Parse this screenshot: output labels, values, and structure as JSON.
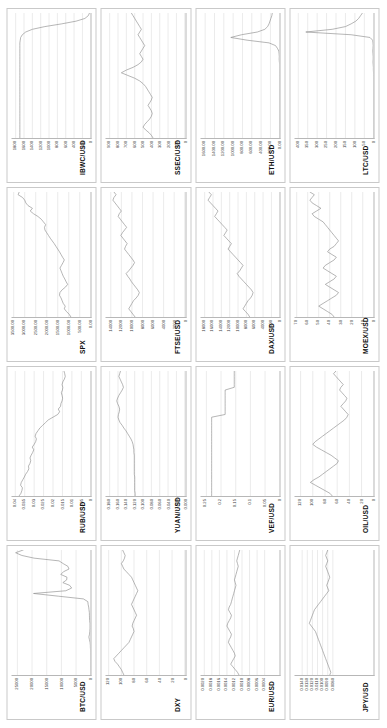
{
  "figure": {
    "type": "small-multiples-grid",
    "rows": 4,
    "columns": 4,
    "series_color": "#8e8e8e",
    "grid_color": "#d7d7d7",
    "axis_color": "#b7b7b7",
    "panel_border_color": "#c9c9c9",
    "background": "#ffffff"
  },
  "chart_data": [
    {
      "type": "line",
      "title": "BTC/USD",
      "xlabel": "",
      "ylabel": "",
      "grid": true,
      "ylim": [
        0,
        27000
      ],
      "yticks": [
        25000,
        20000,
        15000,
        10000,
        5000,
        0
      ],
      "ytick_labels": [
        "25000",
        "20000",
        "15000",
        "10000",
        "5000",
        "0"
      ],
      "values": [
        0,
        0,
        0,
        0,
        0,
        0,
        0,
        0,
        5,
        40,
        120,
        140,
        230,
        450,
        640,
        420,
        330,
        250,
        240,
        250,
        380,
        430,
        450,
        470,
        600,
        700,
        900,
        1000,
        2500,
        11000,
        19500,
        8500,
        6500,
        7200,
        9500,
        8200,
        8100,
        10200,
        9300,
        7400,
        7800,
        9400,
        10800,
        19300,
        23500,
        25600,
        23000
      ]
    },
    {
      "type": "line",
      "title": "RUB/USD",
      "xlabel": "",
      "ylabel": "",
      "grid": true,
      "ylim": [
        0,
        0.042
      ],
      "yticks": [
        0.04,
        0.035,
        0.03,
        0.025,
        0.02,
        0.015,
        0.01,
        0.005,
        0
      ],
      "ytick_labels": [
        "0.04",
        "0.035",
        "0.03",
        "0.025",
        "0.02",
        "0.015",
        "0.01",
        "0.005",
        "0"
      ],
      "values": [
        0.038,
        0.037,
        0.0365,
        0.0362,
        0.0372,
        0.0368,
        0.036,
        0.0352,
        0.0345,
        0.0335,
        0.0328,
        0.033,
        0.0322,
        0.0318,
        0.0322,
        0.0316,
        0.0308,
        0.0302,
        0.031,
        0.03,
        0.0292,
        0.0288,
        0.0295,
        0.029,
        0.028,
        0.027,
        0.0255,
        0.024,
        0.0225,
        0.02,
        0.0175,
        0.0165,
        0.0172,
        0.016,
        0.0158,
        0.0152,
        0.0149,
        0.0152,
        0.0156,
        0.015,
        0.0148,
        0.0152,
        0.0148,
        0.014,
        0.0135,
        0.0138,
        0.0142
      ]
    },
    {
      "type": "line",
      "title": "SPX",
      "xlabel": "",
      "ylabel": "",
      "grid": true,
      "ylim": [
        0,
        3600
      ],
      "yticks": [
        3500,
        3000,
        2500,
        2000,
        1500,
        1000,
        500,
        0
      ],
      "ytick_labels": [
        "3500.00",
        "3000.00",
        "2500.00",
        "2000.00",
        "1500.00",
        "1000.00",
        "500.00",
        "0.00"
      ],
      "values": [
        900,
        980,
        1100,
        1200,
        1160,
        1250,
        1300,
        1350,
        1420,
        1400,
        1300,
        1150,
        1050,
        1120,
        1180,
        1250,
        1300,
        1350,
        1400,
        1330,
        1260,
        1200,
        1280,
        1350,
        1420,
        1500,
        1580,
        1660,
        1750,
        1840,
        1920,
        2000,
        2080,
        2100,
        2050,
        2150,
        2250,
        2400,
        2600,
        2750,
        2650,
        2850,
        2950,
        3000,
        3100,
        3300,
        3250
      ]
    },
    {
      "type": "line",
      "title": "IBWC/USD",
      "xlabel": "",
      "ylabel": "",
      "grid": true,
      "ylim": [
        0,
        1900
      ],
      "yticks": [
        1800,
        1600,
        1400,
        1200,
        1000,
        800,
        600,
        400,
        200,
        0
      ],
      "ytick_labels": [
        "1800",
        "1600",
        "1400",
        "1200",
        "1000",
        "800",
        "600",
        "400",
        "200",
        "0"
      ],
      "values": [
        1700,
        1700,
        1700,
        1700,
        1700,
        1700,
        1700,
        1700,
        1700,
        1700,
        1700,
        1700,
        1700,
        1700,
        1700,
        1700,
        1700,
        1700,
        1700,
        1700,
        1700,
        1700,
        1700,
        1700,
        1700,
        1700,
        1700,
        1700,
        1700,
        1700,
        1700,
        1700,
        1700,
        1700,
        1700,
        1700,
        1690,
        1680,
        1640,
        1560,
        1400,
        1100,
        700,
        350,
        140,
        60,
        30
      ]
    },
    {
      "type": "line",
      "title": "DXY",
      "xlabel": "",
      "ylabel": "",
      "grid": true,
      "ylim": [
        0,
        125
      ],
      "yticks": [
        120,
        100,
        80,
        60,
        40,
        20,
        0
      ],
      "ytick_labels": [
        "120",
        "100",
        "80",
        "60",
        "40",
        "20",
        "0"
      ],
      "values": [
        96,
        98,
        100,
        103,
        106,
        110,
        112,
        108,
        104,
        100,
        96,
        92,
        88,
        86,
        84,
        82,
        80,
        81,
        83,
        82,
        80,
        78,
        76,
        78,
        80,
        82,
        84,
        82,
        80,
        78,
        76,
        74,
        76,
        78,
        80,
        82,
        84,
        88,
        92,
        96,
        98,
        100,
        97,
        95,
        94,
        96,
        98
      ]
    },
    {
      "type": "line",
      "title": "YUAN/USD",
      "xlabel": "",
      "ylabel": "",
      "grid": true,
      "ylim": [
        0,
        0.19
      ],
      "yticks": [
        0.18,
        0.16,
        0.14,
        0.12,
        0.1,
        0.08,
        0.06,
        0.04,
        0.02,
        0.0
      ],
      "ytick_labels": [
        "0.180",
        "0.160",
        "0.140",
        "0.120",
        "0.100",
        "0.080",
        "0.060",
        "0.040",
        "0.020",
        "0.000"
      ],
      "values": [
        0.119,
        0.119,
        0.12,
        0.12,
        0.12,
        0.12,
        0.12,
        0.12,
        0.121,
        0.121,
        0.121,
        0.121,
        0.121,
        0.121,
        0.121,
        0.121,
        0.122,
        0.122,
        0.123,
        0.124,
        0.126,
        0.129,
        0.133,
        0.137,
        0.141,
        0.146,
        0.15,
        0.155,
        0.158,
        0.16,
        0.159,
        0.157,
        0.156,
        0.158,
        0.161,
        0.163,
        0.161,
        0.158,
        0.154,
        0.15,
        0.147,
        0.149,
        0.152,
        0.155,
        0.158,
        0.156,
        0.154
      ]
    },
    {
      "type": "line",
      "title": "FTSE/USD",
      "xlabel": "",
      "ylabel": "",
      "grid": true,
      "ylim": [
        0,
        15000
      ],
      "yticks": [
        14000,
        12000,
        10000,
        8000,
        6000,
        4000,
        2000,
        0
      ],
      "ytick_labels": [
        "14000",
        "12000",
        "10000",
        "8000",
        "6000",
        "4000",
        "2000",
        "0"
      ],
      "values": [
        9400,
        9800,
        10200,
        10600,
        10300,
        10000,
        9700,
        9200,
        8800,
        8600,
        8900,
        9300,
        9700,
        10100,
        10400,
        10800,
        11100,
        10600,
        10200,
        9800,
        9500,
        9800,
        10200,
        10600,
        11000,
        11400,
        11200,
        10900,
        11300,
        11700,
        12100,
        11800,
        11400,
        11000,
        11400,
        11800,
        12200,
        12600,
        12400,
        12000,
        12400,
        12800,
        13200,
        13600,
        13400,
        13000,
        13400
      ]
    },
    {
      "type": "line",
      "title": "SSEC/USD",
      "xlabel": "",
      "ylabel": "",
      "grid": true,
      "ylim": [
        0,
        950
      ],
      "yticks": [
        900,
        800,
        700,
        600,
        500,
        400,
        300,
        200,
        100,
        0
      ],
      "ytick_labels": [
        "900",
        "800",
        "700",
        "600",
        "500",
        "400",
        "300",
        "200",
        "100",
        "0"
      ],
      "values": [
        380,
        400,
        430,
        470,
        500,
        480,
        450,
        420,
        400,
        390,
        400,
        420,
        440,
        420,
        400,
        390,
        410,
        430,
        450,
        470,
        500,
        540,
        600,
        680,
        760,
        700,
        620,
        560,
        520,
        500,
        520,
        540,
        520,
        500,
        480,
        500,
        520,
        540,
        560,
        540,
        520,
        540,
        560,
        580,
        600,
        620,
        640
      ]
    },
    {
      "type": "line",
      "title": "EUR/USD",
      "xlabel": "",
      "ylabel": "",
      "grid": true,
      "ylim": [
        0,
        0.0021
      ],
      "yticks": [
        0.002,
        0.0018,
        0.0016,
        0.0014,
        0.0012,
        0.001,
        0.0008,
        0.0006,
        0.0004
      ],
      "ytick_labels": [
        "0.0020",
        "0.0018",
        "0.0016",
        "0.0014",
        "0.0012",
        "0.0010",
        "0.0008",
        "0.0006",
        "0.0004"
      ],
      "values": [
        0.00108,
        0.00112,
        0.00118,
        0.00124,
        0.0013,
        0.00126,
        0.00122,
        0.00118,
        0.0012,
        0.00124,
        0.00128,
        0.00132,
        0.00136,
        0.00134,
        0.0013,
        0.00128,
        0.00132,
        0.00136,
        0.0014,
        0.00138,
        0.00134,
        0.0013,
        0.00128,
        0.00132,
        0.00136,
        0.00134,
        0.0013,
        0.00128,
        0.00126,
        0.00124,
        0.00122,
        0.0012,
        0.00118,
        0.00116,
        0.00118,
        0.0012,
        0.00118,
        0.00116,
        0.00114,
        0.00112,
        0.0011,
        0.00112,
        0.00114,
        0.00112,
        0.0011,
        0.00108,
        0.00106
      ]
    },
    {
      "type": "line",
      "title": "VEF/USD",
      "xlabel": "",
      "ylabel": "",
      "grid": true,
      "ylim": [
        0,
        0.27
      ],
      "yticks": [
        0.25,
        0.2,
        0.15,
        0.1,
        0.05,
        0
      ],
      "ytick_labels": [
        "0.25",
        "0.2",
        "0.15",
        "0.1",
        "0.05",
        "0"
      ],
      "values": [
        0.232,
        0.232,
        0.232,
        0.232,
        0.232,
        0.232,
        0.232,
        0.232,
        0.232,
        0.232,
        0.232,
        0.232,
        0.232,
        0.232,
        0.232,
        0.232,
        0.232,
        0.232,
        0.232,
        0.232,
        0.232,
        0.232,
        0.232,
        0.232,
        0.232,
        0.232,
        0.232,
        0.232,
        0.232,
        0.232,
        0.186,
        0.186,
        0.186,
        0.186,
        0.186,
        0.186,
        0.186,
        0.186,
        0.186,
        0.186,
        0.155,
        0.155,
        0.155,
        0.155,
        0.155,
        0.155,
        0.155
      ]
    },
    {
      "type": "line",
      "title": "DAX/USD",
      "xlabel": "",
      "ylabel": "",
      "grid": true,
      "ylim": [
        0,
        19000
      ],
      "yticks": [
        18000,
        16000,
        14000,
        12000,
        10000,
        8000,
        6000,
        4000,
        2000,
        0
      ],
      "ytick_labels": [
        "18000",
        "16000",
        "14000",
        "12000",
        "10000",
        "8000",
        "6000",
        "4000",
        "2000",
        "0"
      ],
      "values": [
        7200,
        7600,
        8200,
        8800,
        8400,
        8000,
        7600,
        7000,
        6600,
        6400,
        6800,
        7400,
        8000,
        8600,
        9200,
        9800,
        10200,
        9600,
        9200,
        8800,
        9400,
        10000,
        10600,
        11200,
        11800,
        12400,
        12000,
        11600,
        12200,
        12800,
        13400,
        13000,
        12600,
        13200,
        13800,
        14400,
        15000,
        15600,
        15200,
        14800,
        15400,
        16000,
        16600,
        17200,
        16800,
        16400,
        17000
      ]
    },
    {
      "type": "line",
      "title": "ETH/USD",
      "xlabel": "",
      "ylabel": "",
      "grid": true,
      "ylim": [
        0,
        1700
      ],
      "yticks": [
        1600,
        1400,
        1200,
        1000,
        800,
        600,
        400,
        200,
        0
      ],
      "ytick_labels": [
        "1600.00",
        "1400.00",
        "1200.00",
        "1000.00",
        "800.00",
        "600.00",
        "400.00",
        "200.00",
        "0.00"
      ],
      "values": [
        0,
        0,
        0,
        0,
        0,
        0,
        0,
        0,
        0,
        0,
        0,
        0,
        0,
        0,
        0,
        0,
        0,
        0,
        0,
        0,
        0,
        0,
        0,
        0,
        0,
        0,
        1,
        1,
        8,
        12,
        10,
        14,
        20,
        50,
        90,
        230,
        700,
        1050,
        820,
        480,
        320,
        260,
        230,
        210,
        190,
        170,
        160
      ]
    },
    {
      "type": "line",
      "title": "JPY/USD",
      "xlabel": "",
      "ylabel": "",
      "grid": true,
      "ylim": [
        0,
        0.0155
      ],
      "yticks": [
        0.014,
        0.013,
        0.012,
        0.011,
        0.01,
        0.009,
        0.008
      ],
      "ytick_labels": [
        "0.0140",
        "0.0130",
        "0.0120",
        "0.0110",
        "0.0100",
        "0.0090",
        "0.0080"
      ],
      "values": [
        0.0086,
        0.0084,
        0.0086,
        0.0088,
        0.009,
        0.0092,
        0.0094,
        0.0096,
        0.0098,
        0.01,
        0.0102,
        0.0104,
        0.0106,
        0.0108,
        0.011,
        0.0112,
        0.0114,
        0.0118,
        0.0122,
        0.0126,
        0.0124,
        0.0122,
        0.012,
        0.0118,
        0.0116,
        0.0112,
        0.0108,
        0.0104,
        0.01,
        0.0096,
        0.0092,
        0.0088,
        0.009,
        0.0092,
        0.009,
        0.0088,
        0.0086,
        0.0088,
        0.009,
        0.0092,
        0.0094,
        0.0092,
        0.009,
        0.0092,
        0.0094,
        0.0092,
        0.009
      ]
    },
    {
      "type": "line",
      "title": "OIL/USD",
      "xlabel": "",
      "ylabel": "",
      "grid": true,
      "ylim": [
        0,
        130
      ],
      "yticks": [
        120,
        100,
        80,
        60,
        40,
        20,
        0
      ],
      "ytick_labels": [
        "120",
        "100",
        "80",
        "60",
        "40",
        "20",
        "0"
      ],
      "values": [
        68,
        72,
        80,
        88,
        96,
        104,
        98,
        90,
        84,
        78,
        72,
        66,
        60,
        58,
        64,
        70,
        78,
        86,
        94,
        100,
        96,
        90,
        84,
        78,
        72,
        66,
        60,
        54,
        48,
        44,
        42,
        46,
        50,
        54,
        50,
        46,
        44,
        48,
        52,
        56,
        54,
        50,
        54,
        58,
        62,
        66,
        62
      ]
    },
    {
      "type": "line",
      "title": "MOEX/USD",
      "xlabel": "",
      "ylabel": "",
      "grid": true,
      "ylim": [
        0,
        72
      ],
      "yticks": [
        70,
        60,
        50,
        40,
        30,
        20,
        10,
        0
      ],
      "ytick_labels": [
        "70",
        "60",
        "50",
        "40",
        "30",
        "20",
        "10",
        "0"
      ],
      "values": [
        36,
        38,
        42,
        46,
        50,
        46,
        42,
        38,
        34,
        32,
        36,
        40,
        44,
        40,
        36,
        34,
        38,
        42,
        46,
        44,
        40,
        36,
        34,
        38,
        42,
        40,
        36,
        34,
        32,
        34,
        36,
        38,
        40,
        42,
        44,
        46,
        50,
        54,
        56,
        52,
        48,
        52,
        56,
        58,
        56,
        54,
        58
      ]
    },
    {
      "type": "line",
      "title": "LTC/USD",
      "xlabel": "",
      "ylabel": "",
      "grid": true,
      "ylim": [
        0,
        420
      ],
      "yticks": [
        400,
        350,
        300,
        250,
        200,
        150,
        100,
        50,
        0
      ],
      "ytick_labels": [
        "400",
        "350",
        "300",
        "250",
        "200",
        "150",
        "100",
        "50",
        "0"
      ],
      "values": [
        0,
        0,
        0,
        0,
        0,
        0,
        0,
        0,
        0,
        0,
        0,
        0,
        0,
        0,
        0,
        0,
        0,
        0,
        0,
        0,
        0,
        0,
        0,
        0,
        1,
        2,
        2,
        3,
        4,
        3,
        3,
        4,
        5,
        4,
        3,
        4,
        6,
        20,
        120,
        360,
        220,
        150,
        120,
        95,
        80,
        70,
        60
      ]
    }
  ]
}
